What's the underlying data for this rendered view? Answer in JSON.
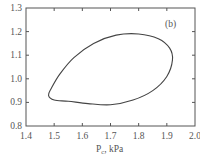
{
  "chart_data": {
    "type": "line",
    "title": "",
    "panel_label": "(b)",
    "xlabel": "P",
    "xlabel_subscript": "c",
    "xlabel_unit": ", kPa",
    "ylabel": "",
    "xlim": [
      1.4,
      2.0
    ],
    "ylim": [
      0.8,
      1.3
    ],
    "xticks": [
      1.4,
      1.5,
      1.6,
      1.7,
      1.8,
      1.9,
      2.0
    ],
    "xtick_labels": [
      "1.4",
      "1.5",
      "1.6",
      "1.7",
      "1.8",
      "1.9",
      "2.0"
    ],
    "yticks": [
      0.8,
      0.9,
      1.0,
      1.1,
      1.2,
      1.3
    ],
    "ytick_labels": [
      "0.8",
      "0.9",
      "1.0",
      "1.1",
      "1.2",
      "1.3"
    ],
    "grid": false,
    "legend": null,
    "series": [
      {
        "name": "closed loop",
        "closed": true,
        "color": "#444444",
        "x": [
          1.48,
          1.5,
          1.55,
          1.62,
          1.7,
          1.78,
          1.85,
          1.9,
          1.92,
          1.91,
          1.87,
          1.8,
          1.72,
          1.64,
          1.57,
          1.52,
          1.49,
          1.48
        ],
        "y": [
          0.93,
          0.91,
          0.905,
          0.895,
          0.89,
          0.91,
          0.95,
          1.01,
          1.08,
          1.13,
          1.17,
          1.19,
          1.185,
          1.15,
          1.09,
          1.02,
          0.96,
          0.93
        ]
      }
    ]
  }
}
